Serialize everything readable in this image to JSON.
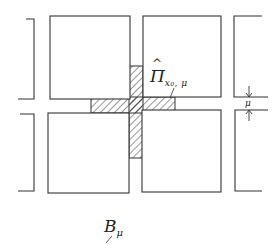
{
  "diagram": {
    "labels": {
      "projection": {
        "symbol": "Π",
        "hat": "^",
        "subscript": "x₀, μ"
      },
      "gap": {
        "symbol": "μ"
      },
      "block": {
        "symbol": "B",
        "subscript": "μ"
      }
    },
    "shapes": {
      "squares": [
        {
          "name": "top-left",
          "x": 50,
          "y": 16,
          "w": 80,
          "h": 83
        },
        {
          "name": "top-right",
          "x": 143,
          "y": 16,
          "w": 78,
          "h": 81
        },
        {
          "name": "bottom-left",
          "x": 48,
          "y": 113,
          "w": 81,
          "h": 80
        },
        {
          "name": "bottom-right",
          "x": 142,
          "y": 110,
          "w": 79,
          "h": 82
        }
      ],
      "hatched_cross": {
        "vertical": {
          "x": 129,
          "y": 66,
          "w": 14,
          "h": 92
        },
        "horizontal": {
          "x": 91,
          "y": 97,
          "w": 84,
          "h": 16
        }
      }
    },
    "colors": {
      "line": "#333333",
      "hatch": "#444444",
      "background": "#ffffff"
    }
  }
}
